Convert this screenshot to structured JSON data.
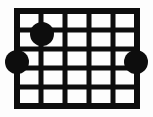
{
  "diagram": {
    "name": "guitar-chord-diagram",
    "type": "fretboard-grid",
    "colors": {
      "background": "#fdfdfd",
      "grid_line": "#0d0d0d",
      "dot_fill": "#0d0d0d"
    },
    "grid": {
      "columns": 5,
      "rows": 5,
      "vertical_line_count": 6,
      "horizontal_line_count": 6,
      "vertical_line_x": [
        17,
        41,
        65,
        89,
        113,
        137
      ],
      "horizontal_line_y": [
        11,
        30,
        49,
        68,
        87,
        106
      ],
      "line_thickness": 5,
      "border_thickness": 6,
      "x_start": 17,
      "x_end": 137,
      "y_start": 11,
      "y_end": 106
    },
    "dots": [
      {
        "label": "finger-dot-top",
        "cx": 42,
        "cy": 34,
        "r": 12,
        "column_line": 2,
        "fret_line": 2
      },
      {
        "label": "finger-dot-left",
        "cx": 17,
        "cy": 62,
        "r": 12,
        "column_line": 1,
        "fret_line": 3
      },
      {
        "label": "finger-dot-right",
        "cx": 136,
        "cy": 62,
        "r": 12,
        "column_line": 6,
        "fret_line": 3
      }
    ]
  }
}
